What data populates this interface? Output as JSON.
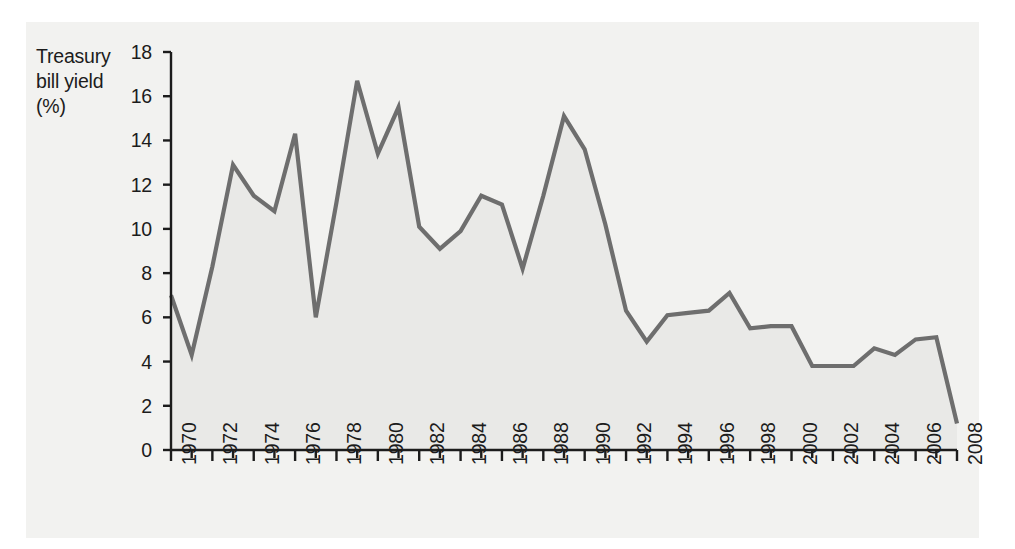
{
  "chart_data": {
    "type": "area",
    "title": "",
    "ylabel": "Treasury\nbill yield\n(%)",
    "xlabel": "",
    "ylim": [
      0,
      18
    ],
    "ytick_values": [
      0,
      2,
      4,
      6,
      8,
      10,
      12,
      14,
      16,
      18
    ],
    "ytick_labels": [
      "0",
      "2",
      "4",
      "6",
      "8",
      "10",
      "12",
      "14",
      "16",
      "18"
    ],
    "xlim": [
      1970,
      2008
    ],
    "xtick_values": [
      1970,
      1972,
      1974,
      1976,
      1978,
      1980,
      1982,
      1984,
      1986,
      1988,
      1990,
      1992,
      1994,
      1996,
      1998,
      2000,
      2002,
      2004,
      2006,
      2008
    ],
    "xtick_labels": [
      "1970",
      "1972",
      "1974",
      "1976",
      "1978",
      "1980",
      "1982",
      "1984",
      "1986",
      "1988",
      "1990",
      "1992",
      "1994",
      "1996",
      "1998",
      "2000",
      "2002",
      "2004",
      "2006",
      "2008"
    ],
    "minor_xticks_every": 1,
    "grid": false,
    "legend": null,
    "line_color": "#6e6e6e",
    "fill_color": "#e9e9e7",
    "axis_color": "#1c1c1c",
    "x": [
      1970,
      1971,
      1972,
      1973,
      1974,
      1975,
      1976,
      1977,
      1978,
      1979,
      1980,
      1981,
      1982,
      1983,
      1984,
      1985,
      1986,
      1987,
      1988,
      1989,
      1990,
      1991,
      1992,
      1993,
      1994,
      1995,
      1996,
      1997,
      1998,
      1999,
      2000,
      2001,
      2002,
      2003,
      2004,
      2005,
      2006,
      2007,
      2008
    ],
    "values": [
      7.0,
      4.3,
      8.3,
      12.9,
      11.5,
      10.8,
      14.3,
      6.0,
      11.2,
      16.7,
      13.4,
      15.5,
      10.1,
      9.1,
      9.9,
      11.5,
      11.1,
      8.2,
      11.5,
      15.1,
      13.6,
      10.2,
      6.3,
      4.9,
      6.1,
      6.2,
      6.3,
      7.1,
      5.5,
      5.6,
      5.6,
      3.8,
      3.8,
      3.8,
      4.6,
      4.3,
      5.0,
      5.1,
      1.2
    ]
  }
}
